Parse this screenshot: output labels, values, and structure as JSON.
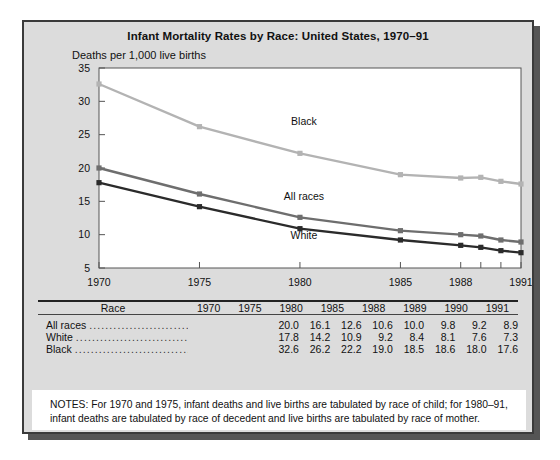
{
  "chart_data": {
    "type": "line",
    "title": "Infant Mortality Rates by Race:  United States, 1970–91",
    "subtitle": "Deaths per 1,000 live births",
    "xlabel": "",
    "ylabel": "Deaths per 1,000 live births",
    "categories": [
      "1970",
      "1975",
      "1980",
      "1985",
      "1988",
      "1989",
      "1990",
      "1991"
    ],
    "tick_labels_shown": [
      "1970",
      "1975",
      "1980",
      "1985",
      "1988",
      "1991"
    ],
    "ylim": [
      5,
      35
    ],
    "yticks": [
      5,
      10,
      15,
      20,
      25,
      30,
      35
    ],
    "grid": false,
    "legend": "inline-labels",
    "series": [
      {
        "name": "All races",
        "color": "#6e6e6e",
        "values": [
          20.0,
          16.1,
          12.6,
          10.6,
          10.0,
          9.8,
          9.2,
          8.9
        ]
      },
      {
        "name": "White",
        "color": "#2b2b2b",
        "values": [
          17.8,
          14.2,
          10.9,
          9.2,
          8.4,
          8.1,
          7.6,
          7.3
        ]
      },
      {
        "name": "Black",
        "color": "#b3b3b3",
        "values": [
          32.6,
          26.2,
          22.2,
          19.0,
          18.5,
          18.6,
          18.0,
          17.6
        ]
      }
    ],
    "annotations": [
      {
        "text": "Black",
        "x": "1980",
        "y": 26.5
      },
      {
        "text": "All races",
        "x": "1980",
        "y": 15.2
      },
      {
        "text": "White",
        "x": "1980",
        "y": 9.3
      }
    ]
  },
  "table": {
    "header": [
      "Race",
      "1970",
      "1975",
      "1980",
      "1985",
      "1988",
      "1989",
      "1990",
      "1991"
    ],
    "rows": [
      {
        "label": "All races",
        "values": [
          "20.0",
          "16.1",
          "12.6",
          "10.6",
          "10.0",
          "9.8",
          "9.2",
          "8.9"
        ]
      },
      {
        "label": "White",
        "values": [
          "17.8",
          "14.2",
          "10.9",
          "9.2",
          "8.4",
          "8.1",
          "7.6",
          "7.3"
        ]
      },
      {
        "label": "Black",
        "values": [
          "32.6",
          "26.2",
          "22.2",
          "19.0",
          "18.5",
          "18.6",
          "18.0",
          "17.6"
        ]
      }
    ]
  },
  "notes": {
    "text": "NOTES: For 1970 and 1975, infant deaths and live births are tabulated by race of child; for 1980–91, infant deaths are tabulated by race of decedent and live births are tabulated by race of mother."
  },
  "colors": {
    "card_bg": "#dcdcdc",
    "card_border": "#3a3a3a",
    "plot_bg": "#ffffff",
    "ink": "#111111"
  }
}
